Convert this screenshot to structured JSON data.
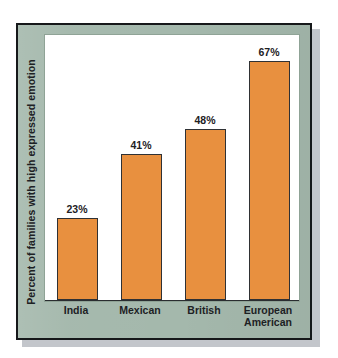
{
  "chart_data": {
    "type": "bar",
    "title": "",
    "subtitle": "",
    "xlabel": "",
    "ylabel": "Percent of families with high expressed emotion",
    "categories": [
      "India",
      "Mexican",
      "British",
      "European American"
    ],
    "category_lines": [
      [
        "India"
      ],
      [
        "Mexican"
      ],
      [
        "British"
      ],
      [
        "European",
        "American"
      ]
    ],
    "values": [
      23,
      41,
      48,
      67
    ],
    "value_labels": [
      "23%",
      "41%",
      "48%",
      "67%"
    ],
    "ylim": [
      0,
      75
    ],
    "grid": false,
    "legend": false,
    "legend_position": "none",
    "series": [
      {
        "name": "Percent of families with high expressed emotion",
        "values": [
          23,
          41,
          48,
          67
        ]
      }
    ],
    "colors": {
      "bar_fill": "#E8903F",
      "bar_outline": "#2F3134",
      "plot_background": "#FFFFFF",
      "panel_background": "#A4B8AC",
      "frame_border": "#16181A",
      "text": "#1D2124",
      "page_background": "#FFFFFF",
      "drop_shadow": "#B9BCC2"
    }
  },
  "figure": {
    "axis_title_y": "Percent of families with high expressed emotion"
  }
}
